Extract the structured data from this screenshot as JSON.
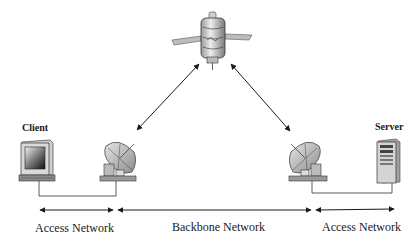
{
  "diagram": {
    "type": "satellite-network-topology",
    "nodes": [
      {
        "id": "client",
        "label": "Client",
        "icon": "desktop-computer-icon"
      },
      {
        "id": "left-dish",
        "label": "",
        "icon": "satellite-dish-icon"
      },
      {
        "id": "satellite",
        "label": "",
        "icon": "satellite-icon"
      },
      {
        "id": "right-dish",
        "label": "",
        "icon": "satellite-dish-icon"
      },
      {
        "id": "server",
        "label": "Server",
        "icon": "server-tower-icon"
      }
    ],
    "links": [
      {
        "from": "client",
        "to": "left-dish",
        "style": "wired"
      },
      {
        "from": "left-dish",
        "to": "satellite",
        "style": "wireless-bidirectional"
      },
      {
        "from": "satellite",
        "to": "right-dish",
        "style": "wireless-bidirectional"
      },
      {
        "from": "right-dish",
        "to": "server",
        "style": "wired"
      }
    ],
    "segments": [
      {
        "id": "left-access",
        "label": "Access Network"
      },
      {
        "id": "backbone",
        "label": "Backbone Network"
      },
      {
        "id": "right-access",
        "label": "Access Network"
      }
    ],
    "colors": {
      "line": "#1a1a1a",
      "device_light": "#d9d9d9",
      "device_mid": "#a6a6a6",
      "device_dark": "#4d4d4d"
    }
  }
}
